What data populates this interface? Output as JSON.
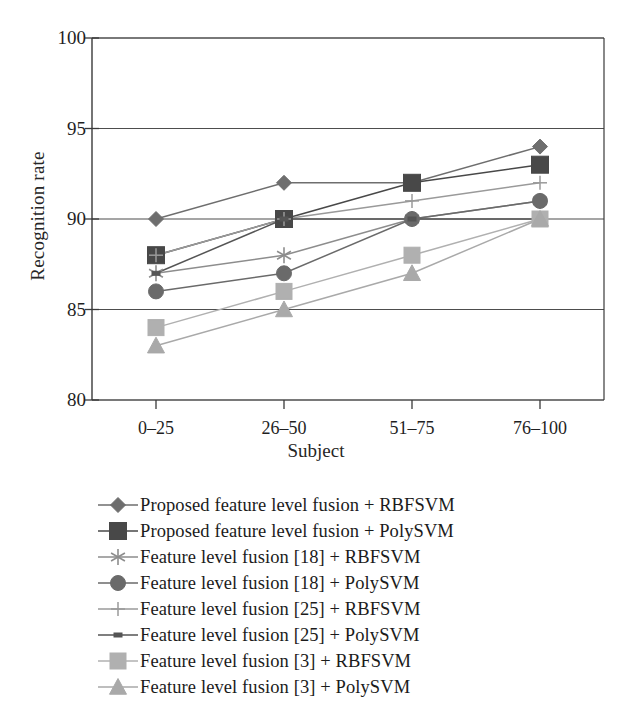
{
  "chart_data": {
    "type": "line",
    "title": "",
    "xlabel": "Subject",
    "ylabel": "Recognition rate",
    "categories": [
      "0–25",
      "26–50",
      "51–75",
      "76–100"
    ],
    "ylim": [
      80,
      100
    ],
    "yticks": [
      80,
      85,
      90,
      95,
      100
    ],
    "grid": true,
    "legend_position": "below",
    "series": [
      {
        "name": "Proposed feature level fusion + RBFSVM",
        "marker": "diamond",
        "color": "#6e6e6e",
        "values": [
          90,
          92,
          92,
          94
        ]
      },
      {
        "name": "Proposed feature level fusion + PolySVM",
        "marker": "square",
        "color": "#484848",
        "values": [
          88,
          90,
          92,
          93
        ]
      },
      {
        "name": "Feature level fusion [18] + RBFSVM",
        "marker": "asterisk",
        "color": "#8d8d8d",
        "values": [
          87,
          88,
          90,
          91
        ]
      },
      {
        "name": "Feature level fusion [18] + PolySVM",
        "marker": "circle",
        "color": "#6a6a6a",
        "values": [
          86,
          87,
          90,
          91
        ]
      },
      {
        "name": "Feature level fusion [25] + RBFSVM",
        "marker": "plus",
        "color": "#9a9a9a",
        "values": [
          88,
          90,
          91,
          92
        ]
      },
      {
        "name": "Feature level fusion [25] + PolySVM",
        "marker": "dash",
        "color": "#555555",
        "values": [
          87,
          90,
          90,
          90
        ]
      },
      {
        "name": "Feature level fusion [3] + RBFSVM",
        "marker": "square-light",
        "color": "#b0b0b0",
        "values": [
          84,
          86,
          88,
          90
        ]
      },
      {
        "name": "Feature level fusion [3] + PolySVM",
        "marker": "triangle",
        "color": "#a9a9a9",
        "values": [
          83,
          85,
          87,
          90
        ]
      }
    ]
  },
  "legend": {
    "items": [
      "Proposed feature level fusion + RBFSVM",
      "Proposed feature level fusion + PolySVM",
      "Feature level fusion [18] + RBFSVM",
      "Feature level fusion [18] + PolySVM",
      "Feature level fusion [25] + RBFSVM",
      "Feature level fusion [25] + PolySVM",
      "Feature level fusion [3] + RBFSVM",
      "Feature level fusion [3] + PolySVM"
    ]
  }
}
